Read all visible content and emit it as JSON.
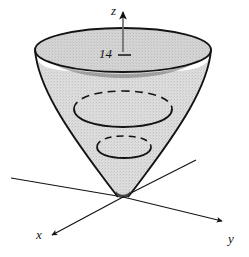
{
  "figure": {
    "kind": "3d-surface-diagram",
    "background_color": "#ffffff",
    "stroke_color": "#131313",
    "surface_fill_color": "#d6d6d6",
    "surface_fill_dark_color": "#b9b9b9",
    "axes": [
      {
        "name": "z-axis",
        "label": "z",
        "direction": "up",
        "arrow": true
      },
      {
        "name": "y-axis",
        "label": "y",
        "direction": "right-down",
        "arrow": true
      },
      {
        "name": "x-axis",
        "label": "x",
        "direction": "left-down",
        "arrow": true
      }
    ],
    "ticks": [
      {
        "axis": "z",
        "label": "14",
        "value": 14
      }
    ],
    "cross_sections": [
      {
        "name": "top-rim",
        "style": "solid",
        "z_label": "14"
      },
      {
        "name": "mid-section",
        "style": "dashed-back-solid-front"
      },
      {
        "name": "lower-section",
        "style": "dashed-back-solid-front"
      }
    ]
  }
}
